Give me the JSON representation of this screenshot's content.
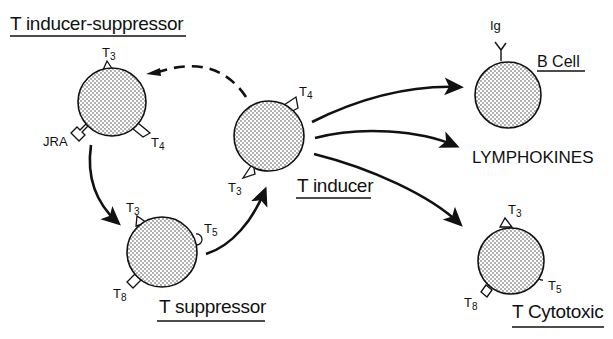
{
  "diagram": {
    "type": "lymphocyte-interaction-diagram",
    "colors": {
      "ink": "#111111",
      "background": "#ffffff",
      "cell_fill": "stippled-dots"
    },
    "cells": [
      {
        "id": "t-inducer-suppressor",
        "title": "T inducer-suppressor",
        "markers": [
          {
            "name": "T",
            "sub": "3",
            "shape": "triangle"
          },
          {
            "name": "T",
            "sub": "4",
            "shape": "triangle"
          },
          {
            "name": "JRA",
            "sub": "",
            "shape": "bracket"
          }
        ]
      },
      {
        "id": "t-inducer",
        "title": "T inducer",
        "markers": [
          {
            "name": "T",
            "sub": "4",
            "shape": "triangle"
          },
          {
            "name": "T",
            "sub": "3",
            "shape": "triangle"
          }
        ]
      },
      {
        "id": "t-suppressor",
        "title": "T suppressor",
        "markers": [
          {
            "name": "T",
            "sub": "3",
            "shape": "triangle"
          },
          {
            "name": "T",
            "sub": "5",
            "shape": "semicircle"
          },
          {
            "name": "T",
            "sub": "8",
            "shape": "rectangle"
          }
        ]
      },
      {
        "id": "b-cell",
        "title": "B Cell",
        "markers": [
          {
            "name": "Ig",
            "sub": "",
            "shape": "y-antibody"
          }
        ]
      },
      {
        "id": "t-cytotoxic",
        "title": "T Cytotoxic",
        "markers": [
          {
            "name": "T",
            "sub": "3",
            "shape": "triangle"
          },
          {
            "name": "T",
            "sub": "5",
            "shape": "semicircle"
          },
          {
            "name": "T",
            "sub": "8",
            "shape": "rectangle"
          }
        ]
      }
    ],
    "products": [
      {
        "id": "lymphokines",
        "label": "LYMPHOKINES"
      }
    ],
    "edges": [
      {
        "from": "t-inducer",
        "to": "t-inducer-suppressor",
        "style": "dashed"
      },
      {
        "from": "t-inducer-suppressor",
        "to": "t-suppressor",
        "style": "solid"
      },
      {
        "from": "t-suppressor",
        "to": "t-inducer",
        "style": "solid"
      },
      {
        "from": "t-inducer",
        "to": "b-cell",
        "style": "solid"
      },
      {
        "from": "t-inducer",
        "to": "lymphokines",
        "style": "solid"
      },
      {
        "from": "t-inducer",
        "to": "t-cytotoxic",
        "style": "solid"
      }
    ]
  }
}
